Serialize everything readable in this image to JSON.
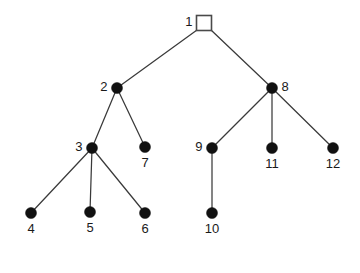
{
  "diagram": {
    "background_color": "#ffffff",
    "edge_color": "#3a3a3a",
    "node_fill_color": "#111111",
    "root_fill_color": "#ffffff",
    "root_stroke_color": "#4a4a4a",
    "label_color": "#1a1a1a"
  },
  "chart_data": {
    "type": "diagram",
    "subtype": "tree-graph",
    "node_count": 12,
    "edge_count": 11,
    "root": "1",
    "nodes": [
      {
        "id": "1",
        "label": "1",
        "x": 204,
        "y": 23,
        "shape": "square",
        "size": 15,
        "filled": false,
        "label_pos": "left"
      },
      {
        "id": "2",
        "label": "2",
        "x": 117,
        "y": 88,
        "shape": "circle",
        "size": 11,
        "filled": true,
        "label_pos": "left"
      },
      {
        "id": "3",
        "label": "3",
        "x": 92,
        "y": 148,
        "shape": "circle",
        "size": 11,
        "filled": true,
        "label_pos": "left"
      },
      {
        "id": "4",
        "label": "4",
        "x": 31,
        "y": 213,
        "shape": "circle",
        "size": 11,
        "filled": true,
        "label_pos": "below"
      },
      {
        "id": "5",
        "label": "5",
        "x": 90,
        "y": 212,
        "shape": "circle",
        "size": 11,
        "filled": true,
        "label_pos": "below"
      },
      {
        "id": "6",
        "label": "6",
        "x": 145,
        "y": 213,
        "shape": "circle",
        "size": 11,
        "filled": true,
        "label_pos": "below"
      },
      {
        "id": "7",
        "label": "7",
        "x": 145,
        "y": 147,
        "shape": "circle",
        "size": 11,
        "filled": true,
        "label_pos": "below"
      },
      {
        "id": "8",
        "label": "8",
        "x": 272,
        "y": 88,
        "shape": "circle",
        "size": 11,
        "filled": true,
        "label_pos": "right"
      },
      {
        "id": "9",
        "label": "9",
        "x": 212,
        "y": 148,
        "shape": "circle",
        "size": 11,
        "filled": true,
        "label_pos": "left"
      },
      {
        "id": "10",
        "label": "10",
        "x": 212,
        "y": 213,
        "shape": "circle",
        "size": 11,
        "filled": true,
        "label_pos": "below"
      },
      {
        "id": "11",
        "label": "11",
        "x": 272,
        "y": 148,
        "shape": "circle",
        "size": 11,
        "filled": true,
        "label_pos": "below"
      },
      {
        "id": "12",
        "label": "12",
        "x": 333,
        "y": 148,
        "shape": "circle",
        "size": 11,
        "filled": true,
        "label_pos": "below"
      }
    ],
    "edges": [
      {
        "from": "1",
        "to": "2",
        "x1": 197,
        "y1": 30,
        "x2": 117,
        "y2": 88
      },
      {
        "from": "1",
        "to": "8",
        "x1": 211,
        "y1": 30,
        "x2": 272,
        "y2": 88
      },
      {
        "from": "2",
        "to": "3",
        "x1": 117,
        "y1": 88,
        "x2": 92,
        "y2": 148
      },
      {
        "from": "2",
        "to": "7",
        "x1": 117,
        "y1": 88,
        "x2": 145,
        "y2": 147
      },
      {
        "from": "3",
        "to": "4",
        "x1": 92,
        "y1": 148,
        "x2": 31,
        "y2": 213
      },
      {
        "from": "3",
        "to": "5",
        "x1": 92,
        "y1": 148,
        "x2": 90,
        "y2": 212
      },
      {
        "from": "3",
        "to": "6",
        "x1": 92,
        "y1": 148,
        "x2": 145,
        "y2": 213
      },
      {
        "from": "8",
        "to": "9",
        "x1": 272,
        "y1": 88,
        "x2": 212,
        "y2": 148
      },
      {
        "from": "8",
        "to": "11",
        "x1": 272,
        "y1": 88,
        "x2": 272,
        "y2": 148
      },
      {
        "from": "8",
        "to": "12",
        "x1": 272,
        "y1": 88,
        "x2": 333,
        "y2": 148
      },
      {
        "from": "9",
        "to": "10",
        "x1": 212,
        "y1": 148,
        "x2": 212,
        "y2": 213
      }
    ]
  }
}
